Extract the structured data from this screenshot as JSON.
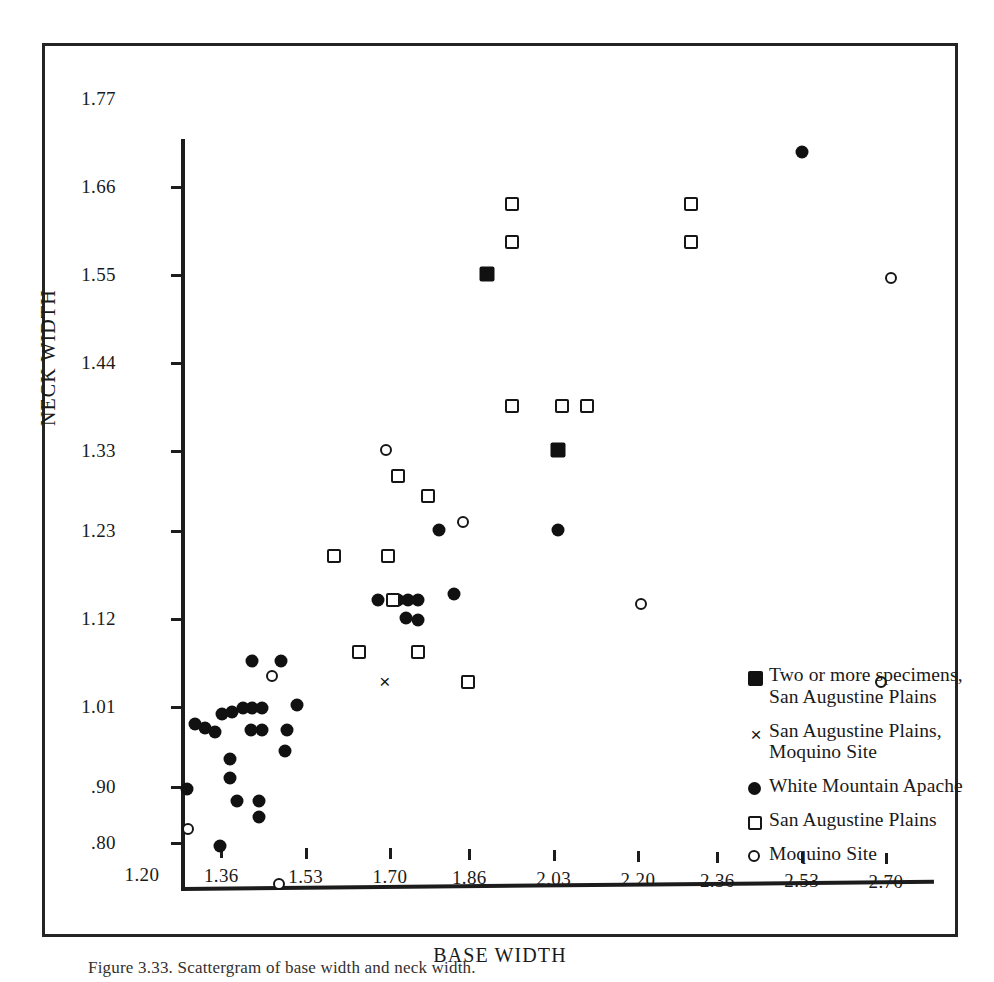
{
  "figure": {
    "caption": "Figure 3.33. Scattergram of base width and neck width."
  },
  "chart_data": {
    "type": "scatter",
    "title": "",
    "xlabel": "BASE WIDTH",
    "ylabel": "NECK WIDTH",
    "xlim": [
      1.2,
      2.7
    ],
    "ylim": [
      0.8,
      1.77
    ],
    "grid": false,
    "legend_position": "inside-bottom-right",
    "x_ticks": [
      "1.20",
      "1.36",
      "1.53",
      "1.70",
      "1.86",
      "2.03",
      "2.20",
      "2.36",
      "2.53",
      "2.70"
    ],
    "x_tick_values": [
      1.2,
      1.36,
      1.53,
      1.7,
      1.86,
      2.03,
      2.2,
      2.36,
      2.53,
      2.7
    ],
    "y_ticks": [
      "1.77",
      "1.66",
      "1.55",
      "1.44",
      "1.33",
      "1.23",
      "1.12",
      "1.01",
      ".90",
      ".80"
    ],
    "y_tick_values": [
      1.77,
      1.66,
      1.55,
      1.44,
      1.33,
      1.23,
      1.12,
      1.01,
      0.9,
      0.8
    ],
    "series": [
      {
        "name": "Two or more specimens, San Augustine Plains",
        "marker": "filled-square",
        "points": [
          [
            1.81,
            1.605
          ],
          [
            1.955,
            1.385
          ]
        ]
      },
      {
        "name": "San Augustine Plains, Moquino Site",
        "marker": "cross",
        "points": [
          [
            1.605,
            1.095
          ]
        ]
      },
      {
        "name": "White Mountain Apache",
        "marker": "filled-circle",
        "points": [
          [
            2.445,
            1.757
          ],
          [
            1.955,
            1.285
          ],
          [
            1.745,
            1.205
          ],
          [
            1.715,
            1.285
          ],
          [
            1.672,
            1.198
          ],
          [
            1.652,
            1.198
          ],
          [
            1.632,
            1.198
          ],
          [
            1.592,
            1.198
          ],
          [
            1.672,
            1.172
          ],
          [
            1.648,
            1.175
          ],
          [
            1.428,
            1.066
          ],
          [
            1.395,
            1.121
          ],
          [
            1.338,
            1.121
          ],
          [
            1.407,
            1.035
          ],
          [
            1.404,
            1.008
          ],
          [
            1.338,
            1.063
          ],
          [
            1.318,
            1.063
          ],
          [
            1.358,
            1.063
          ],
          [
            1.357,
            1.035
          ],
          [
            1.336,
            1.035
          ],
          [
            1.296,
            1.057
          ],
          [
            1.277,
            1.055
          ],
          [
            1.242,
            1.038
          ],
          [
            1.263,
            1.032
          ],
          [
            1.292,
            0.998
          ],
          [
            1.292,
            0.972
          ],
          [
            1.222,
            1.043
          ],
          [
            1.206,
            0.957
          ],
          [
            1.306,
            0.94
          ],
          [
            1.352,
            0.94
          ],
          [
            1.352,
            0.918
          ],
          [
            1.272,
            0.872
          ]
        ]
      },
      {
        "name": "San Augustine Plains",
        "marker": "open-square",
        "points": [
          [
            1.862,
            1.692
          ],
          [
            2.222,
            1.692
          ],
          [
            1.862,
            1.645
          ],
          [
            2.222,
            1.645
          ],
          [
            1.862,
            1.44
          ],
          [
            1.962,
            1.44
          ],
          [
            2.012,
            1.44
          ],
          [
            1.632,
            1.352
          ],
          [
            1.692,
            1.328
          ],
          [
            1.502,
            1.252
          ],
          [
            1.612,
            1.252
          ],
          [
            1.552,
            1.133
          ],
          [
            1.672,
            1.133
          ],
          [
            1.772,
            1.095
          ],
          [
            1.622,
            1.198
          ]
        ]
      },
      {
        "name": "Moquino Site",
        "marker": "open-circle",
        "points": [
          [
            2.625,
            1.6
          ],
          [
            1.608,
            1.385
          ],
          [
            1.762,
            1.295
          ],
          [
            2.122,
            1.192
          ],
          [
            2.605,
            1.095
          ],
          [
            1.378,
            1.103
          ],
          [
            1.208,
            0.902
          ],
          [
            1.392,
            0.803
          ]
        ]
      }
    ]
  },
  "legend": {
    "items": [
      {
        "marker": "filled-square",
        "label": "Two or more specimens,\nSan Augustine Plains",
        "line1": "Two or more specimens,",
        "line2": "San Augustine Plains"
      },
      {
        "marker": "cross",
        "label": "San Augustine Plains,\nMoquino Site",
        "line1": "San Augustine Plains,",
        "line2": "Moquino Site"
      },
      {
        "marker": "filled-circle",
        "label": "White Mountain Apache",
        "line1": "White Mountain Apache",
        "line2": ""
      },
      {
        "marker": "open-square",
        "label": "San Augustine Plains",
        "line1": "San Augustine Plains",
        "line2": ""
      },
      {
        "marker": "open-circle",
        "label": "Moquino Site",
        "line1": "Moquino Site",
        "line2": ""
      }
    ]
  },
  "colors": {
    "ink": "#161616",
    "paper": "#ffffff",
    "frame": "#242424"
  }
}
